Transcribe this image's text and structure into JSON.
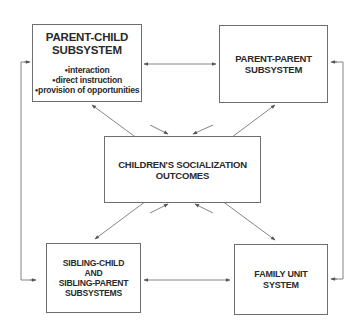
{
  "diagram": {
    "nodes": {
      "parent_child": {
        "title_line1": "PARENT-CHILD",
        "title_line2": "SUBSYSTEM",
        "bullets": [
          "interaction",
          "direct instruction",
          "provision of opportunities"
        ]
      },
      "parent_parent": {
        "title_line1": "PARENT-PARENT",
        "title_line2": "SUBSYSTEM"
      },
      "outcomes": {
        "title_line1": "CHILDREN'S SOCIALIZATION",
        "title_line2": "OUTCOMES"
      },
      "sibling": {
        "title_line1": "SIBLING-CHILD",
        "title_line2": "AND",
        "title_line3": "SIBLING-PARENT",
        "title_line4": "SUBSYSTEMS"
      },
      "family_unit": {
        "title_line1": "FAMILY UNIT",
        "title_line2": "SYSTEM"
      }
    },
    "edges": [
      {
        "from": "parent_child",
        "to": "parent_parent",
        "type": "bidirectional"
      },
      {
        "from": "sibling",
        "to": "family_unit",
        "type": "bidirectional"
      },
      {
        "from": "parent_child",
        "to": "outcomes",
        "type": "bidirectional"
      },
      {
        "from": "parent_parent",
        "to": "outcomes",
        "type": "bidirectional"
      },
      {
        "from": "sibling",
        "to": "outcomes",
        "type": "bidirectional"
      },
      {
        "from": "family_unit",
        "to": "outcomes",
        "type": "bidirectional"
      },
      {
        "from": "parent_child",
        "to": "family_unit",
        "type": "bidirectional"
      },
      {
        "from": "parent_parent",
        "to": "sibling",
        "type": "bidirectional"
      },
      {
        "from": "parent_child",
        "to": "sibling",
        "type": "bidirectional",
        "route": "left-side"
      },
      {
        "from": "parent_parent",
        "to": "family_unit",
        "type": "bidirectional",
        "route": "right-side"
      }
    ],
    "colors": {
      "line": "#6e6e6e",
      "text": "#2a2a2a",
      "background": "#ffffff"
    }
  }
}
